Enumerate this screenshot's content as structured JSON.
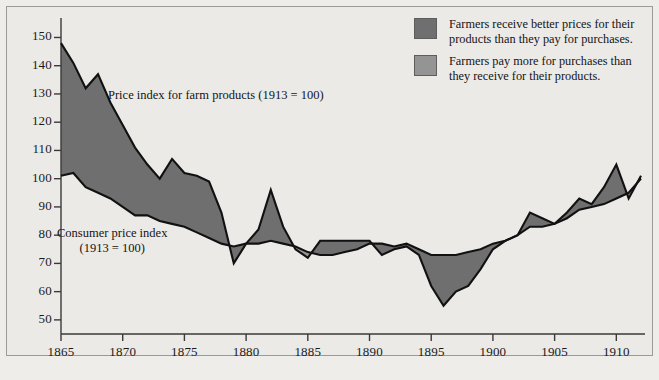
{
  "chart_data": {
    "type": "area",
    "title": "",
    "subtitle": "",
    "xlabel": "",
    "ylabel": "",
    "xlim": [
      1865,
      1912
    ],
    "ylim": [
      45,
      153
    ],
    "yticks": [
      50,
      60,
      70,
      80,
      90,
      100,
      110,
      120,
      130,
      140,
      150
    ],
    "xticks": [
      1865,
      1870,
      1875,
      1880,
      1885,
      1890,
      1895,
      1900,
      1905,
      1910
    ],
    "grid": false,
    "legend_position": "top-right",
    "x": [
      1865,
      1866,
      1867,
      1868,
      1869,
      1870,
      1871,
      1872,
      1873,
      1874,
      1875,
      1876,
      1877,
      1878,
      1879,
      1880,
      1881,
      1882,
      1883,
      1884,
      1885,
      1886,
      1887,
      1888,
      1889,
      1890,
      1891,
      1892,
      1893,
      1894,
      1895,
      1896,
      1897,
      1898,
      1899,
      1900,
      1901,
      1902,
      1903,
      1904,
      1905,
      1906,
      1907,
      1908,
      1909,
      1910,
      1911,
      1912
    ],
    "series": [
      {
        "name": "Price index for farm products (1913 = 100)",
        "color": "#6f6f6f",
        "values": [
          148,
          141,
          132,
          137,
          127,
          119,
          111,
          105,
          100,
          107,
          102,
          101,
          99,
          88,
          70,
          77,
          82,
          96,
          83,
          75,
          72,
          78,
          78,
          78,
          78,
          78,
          73,
          75,
          76,
          73,
          62,
          55,
          60,
          62,
          68,
          75,
          78,
          80,
          88,
          86,
          84,
          88,
          93,
          91,
          97,
          105,
          93,
          101
        ]
      },
      {
        "name": "Consumer price index (1913 = 100)",
        "color": "#949494",
        "values": [
          101,
          102,
          97,
          95,
          93,
          90,
          87,
          87,
          85,
          84,
          83,
          81,
          79,
          77,
          76,
          77,
          77,
          78,
          77,
          76,
          74,
          73,
          73,
          74,
          75,
          77,
          77,
          76,
          77,
          75,
          73,
          73,
          73,
          74,
          75,
          77,
          78,
          80,
          83,
          83,
          84,
          86,
          89,
          90,
          91,
          93,
          95,
          100
        ]
      }
    ],
    "annotations": [
      {
        "name": "farm-series-label",
        "text": "Price index for farm products (1913 = 100)"
      },
      {
        "name": "cpi-series-label-line1",
        "text": "Consumer price index"
      },
      {
        "name": "cpi-series-label-line2",
        "text": "(1913 = 100)"
      }
    ],
    "legend": [
      {
        "color": "#6f6f6f",
        "line1": "Farmers receive better prices for their",
        "line2": "products than they pay for purchases."
      },
      {
        "color": "#949494",
        "line1": "Farmers pay more for purchases than",
        "line2": "they receive for their products."
      }
    ]
  }
}
